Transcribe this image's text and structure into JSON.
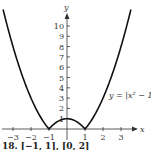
{
  "chart_data": {
    "type": "line",
    "title": "",
    "xlabel": "x",
    "ylabel": "y",
    "annotation": "y = |x² − 1|",
    "x_ticks": [
      "−3",
      "−2",
      "−1",
      "1",
      "2",
      "3"
    ],
    "y_ticks": [
      "1",
      "2",
      "3",
      "4",
      "5",
      "6",
      "7",
      "8",
      "9",
      "10"
    ],
    "xlim": [
      -3.6,
      3.6
    ],
    "ylim": [
      0,
      11
    ],
    "grid": false,
    "series": [
      {
        "name": "y = |x^2 - 1|",
        "x": [
          -3.5,
          -3,
          -2.5,
          -2,
          -1.5,
          -1,
          -0.5,
          0,
          0.5,
          1,
          1.5,
          2,
          2.5,
          3,
          3.5
        ],
        "values": [
          11.25,
          8,
          5.25,
          3,
          1.25,
          0,
          0.75,
          1,
          0.75,
          0,
          1.25,
          3,
          5.25,
          8,
          11.25
        ]
      }
    ]
  },
  "caption_partial": "18. [−1, 1], [0, 2]"
}
